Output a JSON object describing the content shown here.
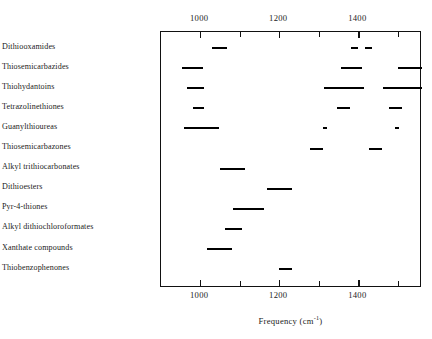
{
  "chart_data": {
    "type": "bar",
    "title": "",
    "subtitle": "",
    "xlabel": "Frequency (cm⁻¹)",
    "ylabel": "",
    "orientation": "horizontal",
    "grid": false,
    "legend": null,
    "xlim": [
      901,
      1561
    ],
    "x_major_ticks": [
      1000,
      1200,
      1400
    ],
    "x_minor_ticks": [
      1100,
      1300,
      1500
    ],
    "x_tick_labels": [
      "1000",
      "1200",
      "1400"
    ],
    "axis_positions": "top and bottom",
    "categories": [
      "Dithiooxamides",
      "Thiosemicarbazides",
      "Thiohydantoins",
      "Tetrazolinethiones",
      "Guanylthioureas",
      "Thiosemicarbazones",
      "Alkyl trithiocarbonates",
      "Dithioesters",
      "Pyr-4-thiones",
      "Alkyl dithiochloroformates",
      "Xanthate compounds",
      "Thiobenzophenones"
    ],
    "rows": [
      {
        "category": "Dithiooxamides",
        "bands": [
          {
            "start": 1030,
            "end": 1068
          },
          {
            "start": 1382,
            "end": 1400
          },
          {
            "start": 1418,
            "end": 1435
          }
        ]
      },
      {
        "category": "Thiosemicarbazides",
        "bands": [
          {
            "start": 954,
            "end": 1007
          },
          {
            "start": 1356,
            "end": 1409
          },
          {
            "start": 1500,
            "end": 1561
          }
        ]
      },
      {
        "category": "Thiohydantoins",
        "bands": [
          {
            "start": 967,
            "end": 1010
          },
          {
            "start": 1313,
            "end": 1414
          },
          {
            "start": 1463,
            "end": 1561
          }
        ]
      },
      {
        "category": "Tetrazolinethiones",
        "bands": [
          {
            "start": 982,
            "end": 1010
          },
          {
            "start": 1346,
            "end": 1379
          },
          {
            "start": 1478,
            "end": 1511
          }
        ]
      },
      {
        "category": "Guanylthioureas",
        "bands": [
          {
            "start": 959,
            "end": 1048
          },
          {
            "start": 1310,
            "end": 1320
          },
          {
            "start": 1492,
            "end": 1502
          }
        ]
      },
      {
        "category": "Thiosemicarbazones",
        "bands": [
          {
            "start": 1277,
            "end": 1310
          },
          {
            "start": 1426,
            "end": 1459
          }
        ]
      },
      {
        "category": "Alkyl trithiocarbonates",
        "bands": [
          {
            "start": 1050,
            "end": 1113
          }
        ]
      },
      {
        "category": "Dithioesters",
        "bands": [
          {
            "start": 1169,
            "end": 1232
          }
        ]
      },
      {
        "category": "Pyr-4-thiones",
        "bands": [
          {
            "start": 1083,
            "end": 1162
          }
        ]
      },
      {
        "category": "Alkyl dithiochloroformates",
        "bands": [
          {
            "start": 1063,
            "end": 1106
          }
        ]
      },
      {
        "category": "Xanthate compounds",
        "bands": [
          {
            "start": 1017,
            "end": 1080
          }
        ]
      },
      {
        "category": "Thiobenzophenones",
        "bands": [
          {
            "start": 1199,
            "end": 1232
          }
        ]
      }
    ]
  },
  "colors": {
    "bar": "#000000",
    "frame": "#111111",
    "text": "#1b1b1b",
    "background": "#ffffff"
  }
}
